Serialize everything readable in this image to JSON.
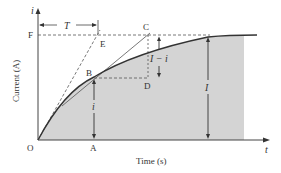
{
  "diagram": {
    "type": "rl-circuit-current-growth",
    "axes": {
      "y_axis_symbol": "i",
      "x_axis_symbol": "t",
      "y_label": "Current (A)",
      "x_label": "Time (s)"
    },
    "points": {
      "O": "O",
      "A": "A",
      "B": "B",
      "C": "C",
      "D": "D",
      "E": "E",
      "F": "F"
    },
    "annotations": {
      "time_constant": "T",
      "final_current": "I",
      "instant_current": "i",
      "remaining_current": "I − i"
    },
    "colors": {
      "fill": "#d4d4d4",
      "curve": "#333333",
      "axis": "#444444",
      "dashed": "#555555"
    }
  }
}
